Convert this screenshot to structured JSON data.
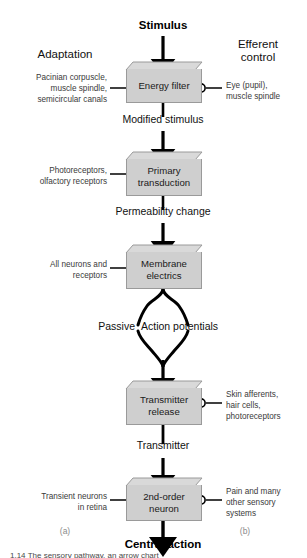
{
  "figure": {
    "columns": {
      "left_header": "Adaptation",
      "right_header": "Efferent\ncontrol",
      "left_panel_letter": "(a)",
      "right_panel_letter": "(b)"
    },
    "top_label": "Stimulus",
    "bottom_label": "Central action",
    "caption_partial": "1.14 The sensory pathway, an arrow chart",
    "boxes": [
      {
        "id": "energy-filter",
        "label": "Energy filter"
      },
      {
        "id": "primary-transduction",
        "label": "Primary\ntransduction"
      },
      {
        "id": "membrane-electrics",
        "label": "Membrane\nelectrics"
      },
      {
        "id": "transmitter-release",
        "label": "Transmitter\nrelease"
      },
      {
        "id": "second-order-neuron",
        "label": "2nd-order\nneuron"
      }
    ],
    "flow_labels": [
      {
        "id": "modified-stimulus",
        "label": "Modified stimulus"
      },
      {
        "id": "permeability-change",
        "label": "Permeability change"
      },
      {
        "id": "passive",
        "label": "Passive"
      },
      {
        "id": "action-potentials",
        "label": "Action potentials"
      },
      {
        "id": "transmitter",
        "label": "Transmitter"
      }
    ],
    "left_annotations": [
      {
        "id": "energy-filter-left",
        "label": "Pacinian corpuscle,\nmuscle spindle,\nsemicircular canals"
      },
      {
        "id": "primary-transduction-left",
        "label": "Photoreceptors,\nolfactory receptors"
      },
      {
        "id": "membrane-electrics-left",
        "label": "All neurons and\nreceptors"
      },
      {
        "id": "second-order-neuron-left",
        "label": "Transient neurons\nin retina"
      }
    ],
    "right_annotations": [
      {
        "id": "energy-filter-right",
        "label": "Eye (pupil),\nmuscle spindle"
      },
      {
        "id": "transmitter-release-right",
        "label": "Skin afferents,\nhair cells,\nphotoreceptors"
      },
      {
        "id": "second-order-neuron-right",
        "label": "Pain and many\nother sensory\nsystems"
      }
    ],
    "colors": {
      "box_face": "#cfcfcf",
      "box_top": "#d9d9d9",
      "box_border": "#9a9a9a",
      "arrow": "#000000",
      "annotation_text": "#3a3a3a",
      "background": "#ffffff"
    }
  }
}
